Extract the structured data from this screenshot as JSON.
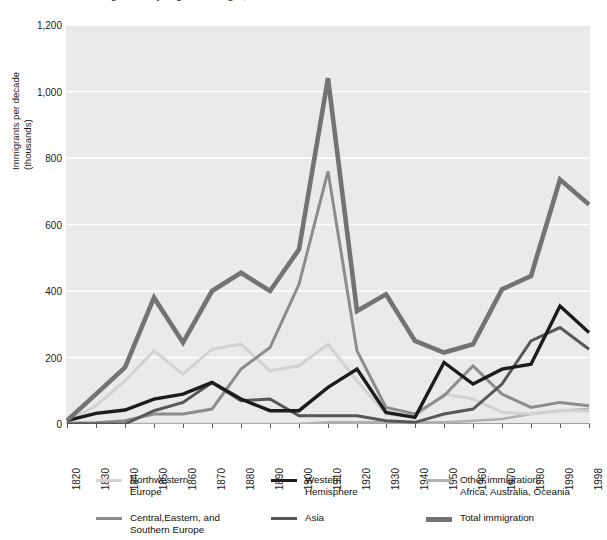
{
  "title": "U.S. immigration by region of origin, 1820–1998",
  "axes": {
    "y_title": "Immigrants per decade\n(thousands)",
    "y_ticks": [
      "0",
      "200",
      "400",
      "600",
      "800",
      "1,000",
      "1,200"
    ],
    "x_ticks": [
      "1820",
      "1830",
      "1840",
      "1850",
      "1860",
      "1870",
      "1880",
      "1890",
      "1900",
      "1910",
      "1920",
      "1930",
      "1940",
      "1950",
      "1960",
      "1970",
      "1980",
      "1990",
      "1998"
    ]
  },
  "colors": {
    "plot_background": "#eaeaea",
    "gridline": "#ffffff",
    "axis": "#555555",
    "northwestern_europe": "#d2d2d2",
    "central_eastern_southern_europe": "#8c8c8c",
    "western_hemisphere": "#1c1c1c",
    "asia": "#575757",
    "other_immigration": "#b0b0b0",
    "total_immigration": "#737373"
  },
  "legend": {
    "position": "below-plot",
    "entries": [
      {
        "name": "northwestern-europe",
        "label": "Northwestern\nEurope",
        "color": "#d2d2d2",
        "width": 3
      },
      {
        "name": "central-eastern-southern-europe",
        "label": "Central,Eastern, and\nSouthern Europe",
        "color": "#8c8c8c",
        "width": 3
      },
      {
        "name": "western-hemisphere",
        "label": "Western\nHemisphere",
        "color": "#1c1c1c",
        "width": 3.4
      },
      {
        "name": "asia",
        "label": "Asia",
        "color": "#575757",
        "width": 3
      },
      {
        "name": "other-immigration",
        "label": "Other immigration:\nAfrica, Australia, Oceania",
        "color": "#b0b0b0",
        "width": 2.6
      },
      {
        "name": "total-immigration",
        "label": "Total immigration",
        "color": "#737373",
        "width": 4.6
      }
    ]
  },
  "chart_data": {
    "type": "line",
    "title": "U.S. immigration by region of origin, 1820–1998",
    "xlabel": "",
    "ylabel": "Immigrants per decade (thousands)",
    "xlim": [
      1820,
      1998
    ],
    "ylim": [
      0,
      1200
    ],
    "grid": true,
    "legend_position": "below",
    "categories": [
      1820,
      1830,
      1840,
      1850,
      1860,
      1870,
      1880,
      1890,
      1900,
      1910,
      1920,
      1930,
      1940,
      1950,
      1960,
      1970,
      1980,
      1990,
      1998
    ],
    "series": [
      {
        "name": "Northwestern Europe",
        "color": "#d2d2d2",
        "values": [
          8,
          90,
          215,
          1000,
          0,
          0,
          0,
          0,
          0,
          0,
          0,
          0,
          0,
          0,
          0,
          0,
          0,
          0,
          0
        ],
        "values_plotted": [
          6,
          55,
          130,
          220,
          150,
          225,
          240,
          160,
          175,
          240,
          130,
          30,
          22,
          90,
          75,
          35,
          30,
          40,
          40
        ]
      },
      {
        "name": "Central,Eastern, and Southern Europe",
        "color": "#8c8c8c",
        "values_plotted": [
          2,
          4,
          10,
          30,
          30,
          45,
          165,
          230,
          420,
          760,
          220,
          50,
          30,
          85,
          175,
          90,
          50,
          65,
          55
        ]
      },
      {
        "name": "Western Hemisphere",
        "color": "#1c1c1c",
        "values_plotted": [
          10,
          32,
          42,
          75,
          90,
          125,
          75,
          40,
          40,
          110,
          165,
          35,
          20,
          185,
          120,
          165,
          180,
          355,
          275
        ]
      },
      {
        "name": "Asia",
        "color": "#575757",
        "values_plotted": [
          0,
          0,
          0,
          40,
          65,
          125,
          70,
          75,
          25,
          25,
          25,
          10,
          5,
          30,
          45,
          120,
          250,
          290,
          225
        ]
      },
      {
        "name": "Other immigration: Africa, Australia, Oceania",
        "color": "#b0b0b0",
        "values_plotted": [
          0,
          0,
          0,
          0,
          0,
          0,
          0,
          0,
          0,
          5,
          5,
          5,
          5,
          5,
          10,
          15,
          30,
          40,
          45
        ]
      },
      {
        "name": "Total immigration",
        "color": "#737373",
        "values_plotted": [
          10,
          90,
          170,
          380,
          245,
          400,
          455,
          400,
          525,
          1040,
          340,
          390,
          250,
          215,
          240,
          405,
          445,
          735,
          660
        ]
      }
    ],
    "notable_points": [
      {
        "series": "Total immigration",
        "x": 1910,
        "y": 1040,
        "note": "peak decade"
      },
      {
        "series": "Central,Eastern, and Southern Europe",
        "x": 1910,
        "y": 760,
        "note": "peak decade"
      },
      {
        "series": "Total immigration",
        "x": 1990,
        "y": 735,
        "note": "modern peak"
      },
      {
        "series": "Total immigration",
        "x": 1940,
        "y": 30,
        "note": "Depression/WWII trough"
      }
    ]
  }
}
